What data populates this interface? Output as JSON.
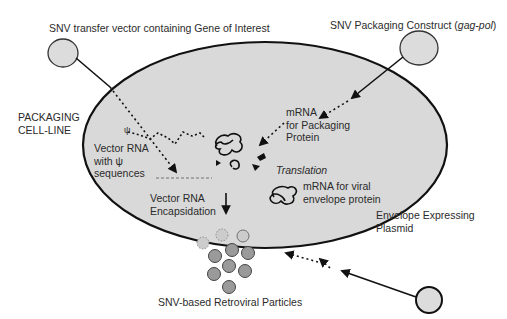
{
  "diagram": {
    "title_labels": {
      "transfer_vector": "SNV transfer vector containing Gene of Interest",
      "packaging_construct_prefix": "SNV Packaging Construct (",
      "packaging_construct_italic": "gag-pol",
      "packaging_construct_suffix": ")",
      "cell_line_line1": "PACKAGING",
      "cell_line_line2": "CELL-LINE",
      "mrna_packaging_line1": "mRNA",
      "mrna_packaging_line2": "for Packaging",
      "mrna_packaging_line3": "Protein",
      "vector_rna_line1": "Vector RNA",
      "vector_rna_line2": "with ψ",
      "vector_rna_line3": "sequences",
      "psi_symbol": "ψ",
      "translation": "Translation",
      "encapsidation_line1": "Vector RNA",
      "encapsidation_line2": "Encapsidation",
      "mrna_envelope_line1": "mRNA for viral",
      "mrna_envelope_line2": "envelope protein",
      "envelope_plasmid_line1": "Envelope Expressing",
      "envelope_plasmid_line2": "Plasmid",
      "particles": "SNV-based Retroviral Particles"
    },
    "colors": {
      "cell_fill": "#d9d9d9",
      "plasmid_fill": "#dcdcdc",
      "particle_fill": "#9a9a9a",
      "stroke": "#111111",
      "text": "#2b2b2b"
    }
  }
}
